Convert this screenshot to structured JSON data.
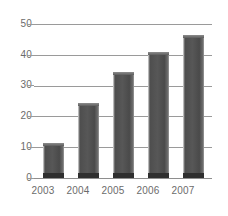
{
  "chart_data": {
    "type": "bar",
    "title": "",
    "subtitle": "",
    "xlabel": "",
    "ylabel": "",
    "categories": [
      "2003",
      "2004",
      "2005",
      "2006",
      "2007"
    ],
    "values": [
      11.5,
      24.5,
      34.5,
      41,
      46.5
    ],
    "series": [
      {
        "name": "",
        "values": [
          11.5,
          24.5,
          34.5,
          41,
          46.5
        ]
      }
    ],
    "ylim": [
      0,
      50
    ],
    "yticks": [
      "0",
      "10",
      "20",
      "30",
      "40",
      "50"
    ],
    "ytick_values": [
      0,
      10,
      20,
      30,
      40,
      50
    ],
    "grid": "horizontal",
    "legend": "none",
    "annotations": [],
    "colors": {
      "bar_face": "#4e4e4e",
      "bar_highlight": "#b9b9b9",
      "bar_base": "#2f2f2f",
      "gridline": "#9a9a9a",
      "label_text": "#6b6b6b",
      "background": "#ffffff"
    }
  }
}
